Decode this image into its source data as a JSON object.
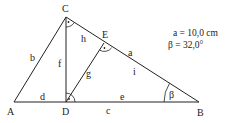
{
  "diagram": {
    "points": {
      "A": {
        "label": "A",
        "x": 14,
        "y": 102
      },
      "B": {
        "label": "B",
        "x": 199,
        "y": 102
      },
      "C": {
        "label": "C",
        "x": 66,
        "y": 17
      },
      "D": {
        "label": "D",
        "x": 66,
        "y": 102
      },
      "E": {
        "label": "E",
        "x": 104,
        "y": 43
      }
    },
    "segments": {
      "a": "a",
      "b": "b",
      "c": "c",
      "d": "d",
      "e": "e",
      "f": "f",
      "g": "g",
      "h": "h",
      "i": "i"
    },
    "angle_label": "β",
    "given": {
      "line1": "a = 10,0 cm",
      "line2": "β = 32,0°"
    },
    "colors": {
      "stroke": "#222222",
      "background": "#ffffff"
    }
  }
}
